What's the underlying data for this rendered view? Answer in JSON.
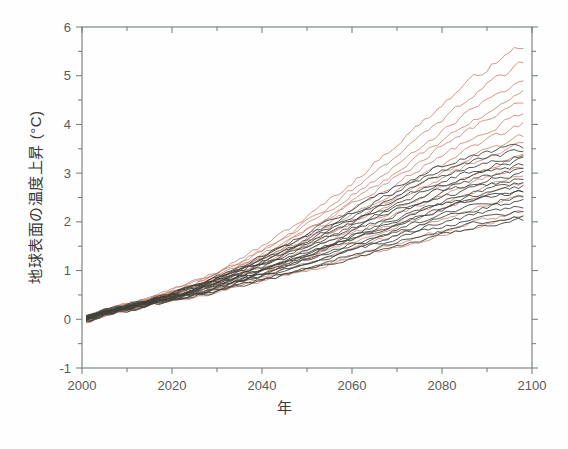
{
  "figure": {
    "background": "#ffffff",
    "axis_color": "#6f7a72",
    "tick_label_color": "#5a5a5a",
    "label_color": "#3a3a3a"
  },
  "axes": {
    "y_label": "地球表面の温度上昇 (°C)",
    "x_label": "年",
    "x_ticks": [
      "2000",
      "2020",
      "2040",
      "2060",
      "2080",
      "2100"
    ],
    "x_tick_values": [
      2000,
      2020,
      2040,
      2060,
      2080,
      2100
    ],
    "y_ticks": [
      "-1",
      "0",
      "1",
      "2",
      "3",
      "4",
      "5",
      "6"
    ],
    "y_tick_values": [
      -1,
      0,
      1,
      2,
      3,
      4,
      5,
      6
    ],
    "x_minor_interval": 10,
    "y_minor_interval": 0.5
  },
  "caption_fragment": "",
  "chart_data": {
    "type": "line",
    "title": "",
    "subtitle": "",
    "xlabel": "年",
    "ylabel": "地球表面の温度上昇 (°C)",
    "xlim": [
      2000,
      2100
    ],
    "ylim": [
      -1,
      6
    ],
    "grid": false,
    "legend": "none",
    "annotations": [],
    "colors": {
      "high_scenario": "#c4735c",
      "low_scenario": "#3c423c"
    },
    "x": [
      2001,
      2005,
      2010,
      2015,
      2020,
      2025,
      2030,
      2035,
      2040,
      2045,
      2050,
      2055,
      2060,
      2065,
      2070,
      2075,
      2080,
      2085,
      2090,
      2095,
      2098
    ],
    "series": [
      {
        "name": "high-01",
        "group": "high_scenario",
        "color": "#c4735c",
        "values": [
          0.05,
          0.22,
          0.3,
          0.45,
          0.62,
          0.8,
          1.0,
          1.25,
          1.5,
          1.8,
          2.1,
          2.45,
          2.8,
          3.2,
          3.6,
          4.0,
          4.4,
          4.8,
          5.15,
          5.45,
          5.62
        ]
      },
      {
        "name": "high-02",
        "group": "high_scenario",
        "color": "#c4735c",
        "values": [
          0.02,
          0.18,
          0.28,
          0.42,
          0.58,
          0.74,
          0.95,
          1.18,
          1.42,
          1.7,
          2.0,
          2.32,
          2.66,
          3.0,
          3.38,
          3.74,
          4.1,
          4.46,
          4.8,
          5.08,
          5.25
        ]
      },
      {
        "name": "high-03",
        "group": "high_scenario",
        "color": "#c4735c",
        "values": [
          0.08,
          0.2,
          0.32,
          0.44,
          0.6,
          0.78,
          0.96,
          1.16,
          1.4,
          1.66,
          1.94,
          2.22,
          2.54,
          2.86,
          3.2,
          3.52,
          3.86,
          4.18,
          4.48,
          4.72,
          4.85
        ]
      },
      {
        "name": "high-04",
        "group": "high_scenario",
        "color": "#c4735c",
        "values": [
          -0.02,
          0.14,
          0.26,
          0.38,
          0.54,
          0.7,
          0.88,
          1.08,
          1.3,
          1.55,
          1.82,
          2.1,
          2.4,
          2.7,
          3.02,
          3.34,
          3.66,
          3.96,
          4.24,
          4.48,
          4.62
        ]
      },
      {
        "name": "high-05",
        "group": "high_scenario",
        "color": "#c4735c",
        "values": [
          0.04,
          0.16,
          0.28,
          0.4,
          0.56,
          0.72,
          0.9,
          1.1,
          1.32,
          1.56,
          1.82,
          2.08,
          2.36,
          2.64,
          2.94,
          3.24,
          3.54,
          3.82,
          4.1,
          4.32,
          4.45
        ]
      },
      {
        "name": "high-06",
        "group": "high_scenario",
        "color": "#c4735c",
        "values": [
          0.0,
          0.15,
          0.25,
          0.38,
          0.52,
          0.68,
          0.86,
          1.05,
          1.26,
          1.48,
          1.72,
          1.98,
          2.24,
          2.52,
          2.8,
          3.08,
          3.36,
          3.62,
          3.88,
          4.08,
          4.2
        ]
      },
      {
        "name": "high-07",
        "group": "high_scenario",
        "color": "#c4735c",
        "values": [
          0.06,
          0.18,
          0.3,
          0.42,
          0.56,
          0.7,
          0.86,
          1.04,
          1.24,
          1.44,
          1.66,
          1.9,
          2.14,
          2.4,
          2.66,
          2.92,
          3.18,
          3.44,
          3.68,
          3.88,
          4.0
        ]
      },
      {
        "name": "high-08",
        "group": "high_scenario",
        "color": "#c4735c",
        "values": [
          -0.04,
          0.1,
          0.22,
          0.34,
          0.48,
          0.62,
          0.78,
          0.96,
          1.14,
          1.34,
          1.56,
          1.78,
          2.02,
          2.26,
          2.5,
          2.76,
          3.0,
          3.24,
          3.46,
          3.64,
          3.75
        ]
      },
      {
        "name": "high-09",
        "group": "high_scenario",
        "color": "#c4735c",
        "values": [
          0.03,
          0.14,
          0.24,
          0.36,
          0.5,
          0.64,
          0.8,
          0.97,
          1.15,
          1.34,
          1.54,
          1.75,
          1.97,
          2.2,
          2.43,
          2.66,
          2.9,
          3.12,
          3.32,
          3.5,
          3.6
        ]
      },
      {
        "name": "high-10",
        "group": "high_scenario",
        "color": "#c4735c",
        "values": [
          0.01,
          0.12,
          0.22,
          0.34,
          0.46,
          0.6,
          0.74,
          0.9,
          1.07,
          1.25,
          1.44,
          1.63,
          1.84,
          2.05,
          2.26,
          2.48,
          2.7,
          2.9,
          3.09,
          3.25,
          3.34
        ]
      },
      {
        "name": "high-11",
        "group": "high_scenario",
        "color": "#c4735c",
        "values": [
          0.05,
          0.16,
          0.26,
          0.36,
          0.48,
          0.6,
          0.74,
          0.88,
          1.04,
          1.2,
          1.38,
          1.56,
          1.75,
          1.94,
          2.14,
          2.34,
          2.54,
          2.73,
          2.9,
          3.04,
          3.12
        ]
      },
      {
        "name": "high-12",
        "group": "high_scenario",
        "color": "#c4735c",
        "values": [
          -0.05,
          0.08,
          0.18,
          0.3,
          0.42,
          0.54,
          0.68,
          0.82,
          0.97,
          1.12,
          1.29,
          1.46,
          1.64,
          1.82,
          2.0,
          2.19,
          2.38,
          2.56,
          2.72,
          2.86,
          2.94
        ]
      },
      {
        "name": "high-13",
        "group": "high_scenario",
        "color": "#c4735c",
        "values": [
          0.02,
          0.12,
          0.22,
          0.32,
          0.44,
          0.56,
          0.68,
          0.82,
          0.96,
          1.1,
          1.26,
          1.42,
          1.58,
          1.75,
          1.92,
          2.09,
          2.26,
          2.42,
          2.58,
          2.7,
          2.78
        ]
      },
      {
        "name": "high-14",
        "group": "high_scenario",
        "color": "#c4735c",
        "values": [
          0.0,
          0.1,
          0.2,
          0.3,
          0.4,
          0.52,
          0.63,
          0.76,
          0.88,
          1.02,
          1.16,
          1.3,
          1.45,
          1.6,
          1.75,
          1.9,
          2.05,
          2.2,
          2.33,
          2.44,
          2.5
        ]
      },
      {
        "name": "high-15",
        "group": "high_scenario",
        "color": "#c4735c",
        "values": [
          0.04,
          0.12,
          0.2,
          0.28,
          0.38,
          0.48,
          0.58,
          0.7,
          0.81,
          0.93,
          1.05,
          1.18,
          1.31,
          1.44,
          1.57,
          1.7,
          1.83,
          1.95,
          2.06,
          2.15,
          2.2
        ]
      },
      {
        "name": "high-16",
        "group": "high_scenario",
        "color": "#c4735c",
        "values": [
          -0.03,
          0.08,
          0.16,
          0.26,
          0.36,
          0.46,
          0.56,
          0.67,
          0.78,
          0.89,
          1.01,
          1.13,
          1.25,
          1.37,
          1.49,
          1.61,
          1.73,
          1.84,
          1.95,
          2.03,
          2.08
        ]
      },
      {
        "name": "low-01",
        "group": "low_scenario",
        "color": "#3c423c",
        "values": [
          0.06,
          0.18,
          0.28,
          0.4,
          0.54,
          0.7,
          0.88,
          1.08,
          1.3,
          1.54,
          1.78,
          2.02,
          2.26,
          2.5,
          2.74,
          2.96,
          3.16,
          3.32,
          3.44,
          3.52,
          3.55
        ]
      },
      {
        "name": "low-02",
        "group": "low_scenario",
        "color": "#3c423c",
        "values": [
          0.02,
          0.16,
          0.26,
          0.38,
          0.52,
          0.68,
          0.85,
          1.04,
          1.25,
          1.48,
          1.71,
          1.95,
          2.18,
          2.41,
          2.64,
          2.85,
          3.04,
          3.2,
          3.33,
          3.41,
          3.45
        ]
      },
      {
        "name": "low-03",
        "group": "low_scenario",
        "color": "#3c423c",
        "values": [
          0.04,
          0.17,
          0.27,
          0.39,
          0.53,
          0.68,
          0.84,
          1.02,
          1.22,
          1.44,
          1.66,
          1.89,
          2.11,
          2.33,
          2.55,
          2.75,
          2.94,
          3.1,
          3.23,
          3.32,
          3.36
        ]
      },
      {
        "name": "low-04",
        "group": "low_scenario",
        "color": "#3c423c",
        "values": [
          0.0,
          0.14,
          0.24,
          0.36,
          0.5,
          0.65,
          0.81,
          0.99,
          1.18,
          1.39,
          1.6,
          1.82,
          2.03,
          2.25,
          2.46,
          2.66,
          2.85,
          3.0,
          3.13,
          3.22,
          3.26
        ]
      },
      {
        "name": "low-05",
        "group": "low_scenario",
        "color": "#3c423c",
        "values": [
          0.07,
          0.18,
          0.29,
          0.4,
          0.53,
          0.67,
          0.82,
          0.99,
          1.17,
          1.36,
          1.56,
          1.77,
          1.97,
          2.18,
          2.38,
          2.57,
          2.75,
          2.9,
          3.03,
          3.12,
          3.17
        ]
      },
      {
        "name": "low-06",
        "group": "low_scenario",
        "color": "#3c423c",
        "values": [
          -0.02,
          0.12,
          0.22,
          0.34,
          0.47,
          0.62,
          0.77,
          0.94,
          1.12,
          1.31,
          1.51,
          1.71,
          1.91,
          2.11,
          2.31,
          2.49,
          2.67,
          2.82,
          2.94,
          3.03,
          3.08
        ]
      },
      {
        "name": "low-07",
        "group": "low_scenario",
        "color": "#3c423c",
        "values": [
          0.03,
          0.15,
          0.25,
          0.36,
          0.49,
          0.63,
          0.78,
          0.94,
          1.11,
          1.29,
          1.48,
          1.67,
          1.86,
          2.05,
          2.24,
          2.42,
          2.59,
          2.74,
          2.86,
          2.95,
          3.0
        ]
      },
      {
        "name": "low-08",
        "group": "low_scenario",
        "color": "#3c423c",
        "values": [
          0.05,
          0.16,
          0.26,
          0.37,
          0.49,
          0.62,
          0.76,
          0.92,
          1.08,
          1.25,
          1.43,
          1.61,
          1.79,
          1.98,
          2.16,
          2.33,
          2.5,
          2.64,
          2.76,
          2.85,
          2.9
        ]
      },
      {
        "name": "low-09",
        "group": "low_scenario",
        "color": "#3c423c",
        "values": [
          -0.04,
          0.1,
          0.21,
          0.32,
          0.45,
          0.58,
          0.72,
          0.87,
          1.03,
          1.2,
          1.37,
          1.55,
          1.73,
          1.91,
          2.08,
          2.25,
          2.41,
          2.55,
          2.67,
          2.76,
          2.81
        ]
      },
      {
        "name": "low-10",
        "group": "low_scenario",
        "color": "#3c423c",
        "values": [
          0.01,
          0.13,
          0.23,
          0.34,
          0.46,
          0.59,
          0.72,
          0.87,
          1.02,
          1.18,
          1.35,
          1.52,
          1.69,
          1.86,
          2.03,
          2.19,
          2.35,
          2.48,
          2.6,
          2.68,
          2.73
        ]
      },
      {
        "name": "low-11",
        "group": "low_scenario",
        "color": "#3c423c",
        "values": [
          0.06,
          0.16,
          0.26,
          0.36,
          0.47,
          0.59,
          0.72,
          0.86,
          1.0,
          1.15,
          1.31,
          1.47,
          1.63,
          1.79,
          1.95,
          2.11,
          2.26,
          2.39,
          2.5,
          2.58,
          2.63
        ]
      },
      {
        "name": "low-12",
        "group": "low_scenario",
        "color": "#3c423c",
        "values": [
          0.0,
          0.12,
          0.22,
          0.32,
          0.43,
          0.55,
          0.67,
          0.8,
          0.94,
          1.09,
          1.24,
          1.39,
          1.54,
          1.7,
          1.85,
          2.0,
          2.15,
          2.28,
          2.39,
          2.47,
          2.52
        ]
      },
      {
        "name": "low-13",
        "group": "low_scenario",
        "color": "#3c423c",
        "values": [
          0.03,
          0.13,
          0.23,
          0.33,
          0.44,
          0.55,
          0.67,
          0.8,
          0.93,
          1.07,
          1.21,
          1.36,
          1.5,
          1.65,
          1.79,
          1.94,
          2.08,
          2.2,
          2.31,
          2.38,
          2.43
        ]
      },
      {
        "name": "low-14",
        "group": "low_scenario",
        "color": "#3c423c",
        "values": [
          -0.03,
          0.09,
          0.19,
          0.29,
          0.4,
          0.51,
          0.62,
          0.75,
          0.88,
          1.01,
          1.15,
          1.29,
          1.43,
          1.57,
          1.71,
          1.85,
          1.98,
          2.1,
          2.2,
          2.28,
          2.32
        ]
      },
      {
        "name": "low-15",
        "group": "low_scenario",
        "color": "#3c423c",
        "values": [
          0.04,
          0.14,
          0.23,
          0.32,
          0.42,
          0.53,
          0.64,
          0.76,
          0.88,
          1.01,
          1.14,
          1.27,
          1.4,
          1.53,
          1.66,
          1.79,
          1.91,
          2.02,
          2.12,
          2.19,
          2.23
        ]
      },
      {
        "name": "low-16",
        "group": "low_scenario",
        "color": "#3c423c",
        "values": [
          0.02,
          0.11,
          0.2,
          0.29,
          0.39,
          0.49,
          0.6,
          0.71,
          0.83,
          0.95,
          1.07,
          1.2,
          1.32,
          1.45,
          1.57,
          1.69,
          1.81,
          1.92,
          2.01,
          2.08,
          2.12
        ]
      },
      {
        "name": "low-17",
        "group": "low_scenario",
        "color": "#3c423c",
        "values": [
          -0.05,
          0.08,
          0.17,
          0.27,
          0.36,
          0.46,
          0.57,
          0.68,
          0.79,
          0.91,
          1.03,
          1.15,
          1.27,
          1.39,
          1.51,
          1.63,
          1.74,
          1.85,
          1.94,
          2.01,
          2.05
        ]
      },
      {
        "name": "low-18",
        "group": "low_scenario",
        "color": "#3c423c",
        "values": [
          0.05,
          0.15,
          0.24,
          0.34,
          0.45,
          0.57,
          0.7,
          0.84,
          0.99,
          1.14,
          1.3,
          1.46,
          1.62,
          1.78,
          1.94,
          2.1,
          2.25,
          2.38,
          2.49,
          2.57,
          2.62
        ]
      }
    ]
  }
}
